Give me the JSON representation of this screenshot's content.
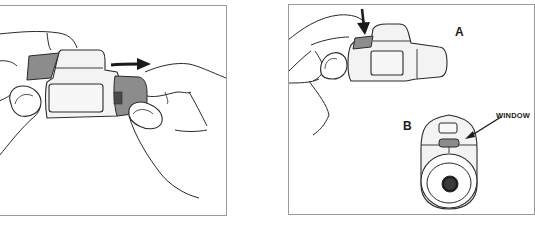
{
  "figure": {
    "panels": [
      {
        "id": "panel-1",
        "description": "Two hands pulling the device apart; arrow pointing right",
        "arrow_direction": "right"
      },
      {
        "id": "panel-2",
        "description": "Pressing the button on the device (A); bottom view of device showing window (B)",
        "arrow_direction": "down"
      }
    ],
    "labels": {
      "a": "A",
      "b": "B",
      "window": "WINDOW"
    },
    "colors": {
      "line": "#2a2a2a",
      "cap_gray": "#8c8c8c",
      "body_fill": "#f3f3f3",
      "border": "#9a9a9a",
      "dark_center": "#1a1a1a"
    }
  }
}
